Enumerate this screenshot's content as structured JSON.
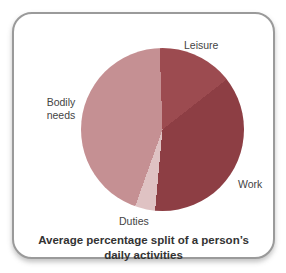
{
  "chart_data": {
    "type": "pie",
    "title": "Average percentage split of a person’s daily activities",
    "legend": "none",
    "labels_position": "outside",
    "start_angle_deg": -2,
    "slices": [
      {
        "label": "Leisure",
        "value_percent": 15,
        "color": "#9c4b50"
      },
      {
        "label": "Work",
        "value_percent": 37,
        "color": "#8d3e44"
      },
      {
        "label": "Duties",
        "value_percent": 4,
        "color": "#dfc2c3"
      },
      {
        "label": "Bodily needs",
        "value_percent": 44,
        "color": "#c59093"
      }
    ]
  },
  "card": {
    "border_color": "#9a9a9a",
    "background_color": "#ffffff"
  }
}
